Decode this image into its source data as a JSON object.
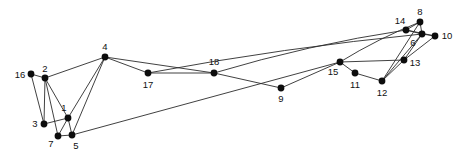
{
  "figure": {
    "type": "node-link-graph",
    "width": 461,
    "height": 155,
    "background_color": "#ffffff",
    "node_color": "#0d0d0d",
    "edge_color": "#2b2b2b",
    "label_color": "#111111",
    "node_radius": 3.4,
    "edge_width": 0.9,
    "label_font_size": 9.5
  },
  "chart_data": {
    "type": "scatter",
    "title": "",
    "xlabel": "",
    "ylabel": "",
    "grid": false,
    "legend": null,
    "xlim": [
      0,
      461
    ],
    "ylim": [
      0,
      155
    ],
    "nodes": [
      {
        "id": "1",
        "label": "1",
        "x": 68,
        "y": 118,
        "label_x": 64,
        "label_y": 108,
        "label_anchor": "middle"
      },
      {
        "id": "2",
        "label": "2",
        "x": 45,
        "y": 78,
        "label_x": 45,
        "label_y": 69,
        "label_anchor": "middle"
      },
      {
        "id": "3",
        "label": "3",
        "x": 44,
        "y": 124,
        "label_x": 35,
        "label_y": 124,
        "label_anchor": "middle"
      },
      {
        "id": "4",
        "label": "4",
        "x": 105,
        "y": 57,
        "label_x": 105,
        "label_y": 47,
        "label_anchor": "middle"
      },
      {
        "id": "5",
        "label": "5",
        "x": 72,
        "y": 135,
        "label_x": 76,
        "label_y": 146,
        "label_anchor": "middle"
      },
      {
        "id": "6",
        "label": "6",
        "x": 422,
        "y": 34,
        "label_x": 413,
        "label_y": 43,
        "label_anchor": "middle"
      },
      {
        "id": "7",
        "label": "7",
        "x": 58,
        "y": 136,
        "label_x": 51,
        "label_y": 144,
        "label_anchor": "middle"
      },
      {
        "id": "8",
        "label": "8",
        "x": 420,
        "y": 22,
        "label_x": 420,
        "label_y": 12,
        "label_anchor": "middle"
      },
      {
        "id": "9",
        "label": "9",
        "x": 281,
        "y": 88,
        "label_x": 281,
        "label_y": 99,
        "label_anchor": "middle"
      },
      {
        "id": "10",
        "label": "10",
        "x": 435,
        "y": 36,
        "label_x": 447,
        "label_y": 36,
        "label_anchor": "middle"
      },
      {
        "id": "11",
        "label": "11",
        "x": 355,
        "y": 73,
        "label_x": 355,
        "label_y": 85,
        "label_anchor": "middle"
      },
      {
        "id": "12",
        "label": "12",
        "x": 382,
        "y": 81,
        "label_x": 382,
        "label_y": 93,
        "label_anchor": "middle"
      },
      {
        "id": "13",
        "label": "13",
        "x": 404,
        "y": 60,
        "label_x": 415,
        "label_y": 63,
        "label_anchor": "middle"
      },
      {
        "id": "14",
        "label": "14",
        "x": 406,
        "y": 30,
        "label_x": 400,
        "label_y": 21,
        "label_anchor": "middle"
      },
      {
        "id": "15",
        "label": "15",
        "x": 340,
        "y": 62,
        "label_x": 333,
        "label_y": 72,
        "label_anchor": "middle"
      },
      {
        "id": "16",
        "label": "16",
        "x": 31,
        "y": 74,
        "label_x": 20,
        "label_y": 75,
        "label_anchor": "middle"
      },
      {
        "id": "17",
        "label": "17",
        "x": 148,
        "y": 73,
        "label_x": 148,
        "label_y": 85,
        "label_anchor": "middle"
      },
      {
        "id": "18",
        "label": "18",
        "x": 214,
        "y": 73,
        "label_x": 214,
        "label_y": 62,
        "label_anchor": "middle"
      }
    ],
    "edges": [
      {
        "source": "16",
        "target": "2",
        "curve": 0
      },
      {
        "source": "16",
        "target": "3",
        "curve": 0
      },
      {
        "source": "2",
        "target": "3",
        "curve": 0
      },
      {
        "source": "2",
        "target": "1",
        "curve": 0
      },
      {
        "source": "2",
        "target": "7",
        "curve": 0
      },
      {
        "source": "2",
        "target": "4",
        "curve": 0
      },
      {
        "source": "3",
        "target": "1",
        "curve": 0
      },
      {
        "source": "1",
        "target": "7",
        "curve": 0
      },
      {
        "source": "1",
        "target": "5",
        "curve": 0
      },
      {
        "source": "1",
        "target": "4",
        "curve": 0
      },
      {
        "source": "7",
        "target": "5",
        "curve": 0
      },
      {
        "source": "5",
        "target": "4",
        "curve": 0
      },
      {
        "source": "5",
        "target": "15",
        "curve": 0
      },
      {
        "source": "4",
        "target": "17",
        "curve": 0
      },
      {
        "source": "4",
        "target": "18",
        "curve": 0
      },
      {
        "source": "17",
        "target": "18",
        "curve": 0
      },
      {
        "source": "18",
        "target": "9",
        "curve": 0
      },
      {
        "source": "18",
        "target": "14",
        "curve": -7
      },
      {
        "source": "9",
        "target": "15",
        "curve": 0
      },
      {
        "source": "17",
        "target": "6",
        "curve": -6
      },
      {
        "source": "15",
        "target": "11",
        "curve": 0
      },
      {
        "source": "15",
        "target": "8",
        "curve": -4
      },
      {
        "source": "15",
        "target": "13",
        "curve": 0
      },
      {
        "source": "11",
        "target": "12",
        "curve": 0
      },
      {
        "source": "12",
        "target": "8",
        "curve": 0
      },
      {
        "source": "12",
        "target": "6",
        "curve": 0
      },
      {
        "source": "12",
        "target": "13",
        "curve": 0
      },
      {
        "source": "14",
        "target": "8",
        "curve": 0
      },
      {
        "source": "14",
        "target": "6",
        "curve": 0
      },
      {
        "source": "14",
        "target": "10",
        "curve": 0
      },
      {
        "source": "8",
        "target": "6",
        "curve": 0
      },
      {
        "source": "6",
        "target": "10",
        "curve": 0
      },
      {
        "source": "13",
        "target": "10",
        "curve": 0
      },
      {
        "source": "13",
        "target": "6",
        "curve": 0
      }
    ]
  }
}
